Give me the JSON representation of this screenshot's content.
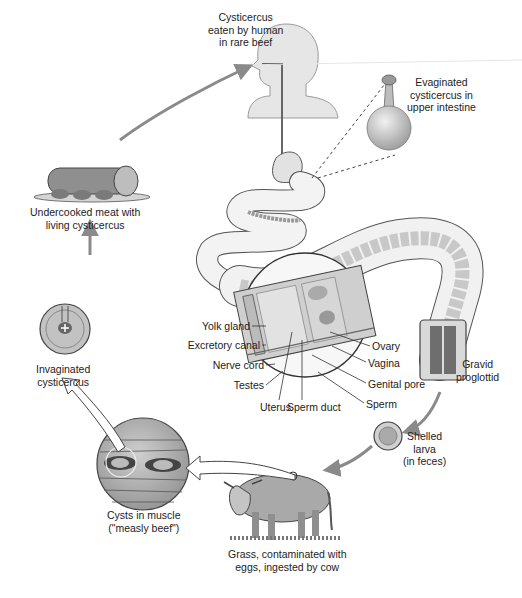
{
  "stages": {
    "human_ingestion": {
      "lines": [
        "Cysticercus",
        "eaten by human",
        "in rare beef"
      ]
    },
    "evaginated": {
      "lines": [
        "Evaginated",
        "cysticercus in",
        "upper intestine"
      ]
    },
    "undercooked_meat": {
      "lines": [
        "Undercooked meat with",
        "living cysticercus"
      ]
    },
    "invaginated": {
      "lines": [
        "Invaginated",
        "cysticercus"
      ]
    },
    "gravid_proglottid": {
      "lines": [
        "Gravid",
        "proglottid"
      ]
    },
    "shelled_larva": {
      "lines": [
        "Shelled",
        "larva",
        "(in feces)"
      ]
    },
    "cysts_in_muscle": {
      "lines": [
        "Cysts in muscle",
        "(\"measly beef\")"
      ]
    },
    "grass_cow": {
      "lines": [
        "Grass, contaminated with",
        "eggs, ingested by cow"
      ]
    }
  },
  "proglottid_labels": {
    "left": [
      "Yolk gland",
      "Excretory canal",
      "Nerve cord",
      "Testes"
    ],
    "bottom": [
      "Uterus",
      "Sperm duct"
    ],
    "right": [
      "Ovary",
      "Vagina",
      "Genital pore",
      "Sperm"
    ]
  },
  "colors": {
    "arrow": "#8a8a8a",
    "outline": "#444444",
    "fill_light": "#e4e4e4",
    "fill_mid": "#bdbdbd",
    "fill_dark": "#7d7d7d"
  }
}
